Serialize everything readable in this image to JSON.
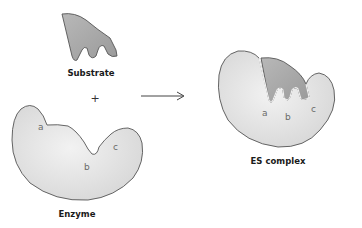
{
  "diagram": {
    "labels": {
      "substrate": "Substrate",
      "enzyme": "Enzyme",
      "complex": "ES complex",
      "plus": "+"
    },
    "binding_sites": {
      "enzyme": [
        "a",
        "b",
        "c"
      ],
      "complex": [
        "a",
        "b",
        "c"
      ]
    },
    "colors": {
      "enzyme_fill": "#dedede",
      "enzyme_fill_light": "#efefef",
      "substrate_fill": "#a6a6a6",
      "outline": "#555555",
      "arrow": "#444444",
      "site_label": "#6a6a6a"
    }
  }
}
